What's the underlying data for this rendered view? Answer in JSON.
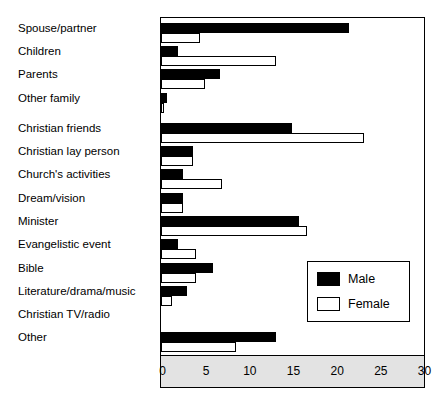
{
  "chart_data": {
    "type": "bar",
    "orientation": "horizontal",
    "title": "",
    "subtitle": "",
    "xlabel": "",
    "ylabel": "",
    "xlim": [
      0,
      30
    ],
    "ylim": null,
    "grid": false,
    "legend_position": "inside-right-lower",
    "xticks": [
      0,
      5,
      10,
      15,
      20,
      25,
      30
    ],
    "xtick_labels": [
      "0",
      "5",
      "10",
      "15",
      "20",
      "25",
      "30"
    ],
    "categories": [
      "Spouse/partner",
      "Children",
      "Parents",
      "Other family",
      "Christian friends",
      "Christian lay person",
      "Church's activities",
      "Dream/vision",
      "Minister",
      "Evangelistic event",
      "Bible",
      "Literature/drama/music",
      "Christian TV/radio",
      "Other"
    ],
    "series": [
      {
        "name": "Male",
        "color": "#000000",
        "values": [
          21.5,
          2.0,
          6.8,
          0.7,
          15.0,
          3.7,
          2.5,
          2.5,
          15.8,
          2.0,
          6.0,
          3.0,
          0.0,
          13.2
        ]
      },
      {
        "name": "Female",
        "color": "#ffffff",
        "values": [
          4.5,
          13.2,
          5.0,
          0.4,
          23.2,
          3.7,
          7.0,
          2.5,
          16.7,
          4.0,
          4.0,
          1.3,
          0.0,
          8.6
        ]
      }
    ]
  },
  "legend": {
    "entries": [
      {
        "label": "Male",
        "swatch": "male-swatch"
      },
      {
        "label": "Female",
        "swatch": "female-swatch"
      }
    ]
  }
}
